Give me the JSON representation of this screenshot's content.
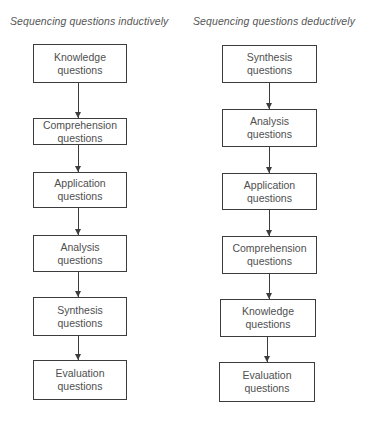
{
  "diagram": {
    "left": {
      "title": "Sequencing questions inductively",
      "steps": [
        {
          "line1": "Knowledge",
          "line2": "questions"
        },
        {
          "line1": "Comprehension",
          "line2": "questions"
        },
        {
          "line1": "Application",
          "line2": "questions"
        },
        {
          "line1": "Analysis",
          "line2": "questions"
        },
        {
          "line1": "Synthesis",
          "line2": "questions"
        },
        {
          "line1": "Evaluation",
          "line2": "questions"
        }
      ]
    },
    "right": {
      "title": "Sequencing questions deductively",
      "steps": [
        {
          "line1": "Synthesis",
          "line2": "questions"
        },
        {
          "line1": "Analysis",
          "line2": "questions"
        },
        {
          "line1": "Application",
          "line2": "questions"
        },
        {
          "line1": "Comprehension",
          "line2": "questions"
        },
        {
          "line1": "Knowledge",
          "line2": "questions"
        },
        {
          "line1": "Evaluation",
          "line2": "questions"
        }
      ]
    },
    "colors": {
      "border": "#3c3c3c",
      "text": "#4f4f4f",
      "background": "#ffffff"
    }
  }
}
